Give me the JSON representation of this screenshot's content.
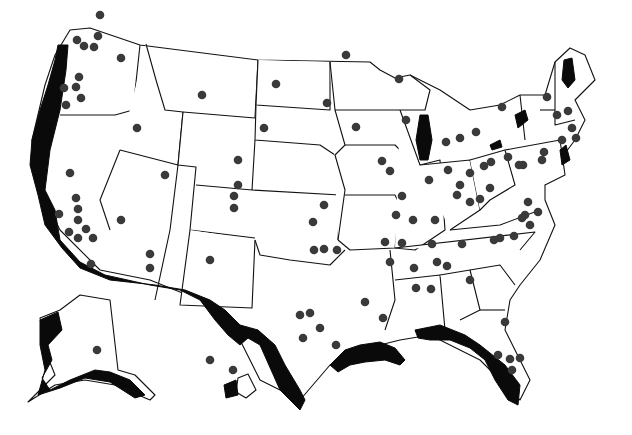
{
  "map": {
    "title": "",
    "width": 632,
    "height": 435,
    "colors": {
      "background": "#ffffff",
      "outline": "#111111",
      "shaded": "#0a0a0a",
      "dot": "#3a3a3a"
    },
    "legend": null,
    "regions": [
      {
        "name": "contiguous-us",
        "path": "M70,30 L90,28 L140,45 L258,60 L370,62 L380,70 L395,78 L410,75 L440,90 L470,110 L500,105 L520,95 L545,95 L555,62 L570,48 L585,55 L595,80 L575,100 L585,120 L575,140 L560,160 L545,175 L545,200 L555,225 L540,260 L520,285 L510,300 L505,330 L530,380 L520,400 L480,360 L430,335 L400,340 L360,350 L330,365 L300,400 L260,380 L230,320 L200,300 L150,280 L100,270 L60,230 L35,180 L32,140 L45,85 L55,55 Z"
      },
      {
        "name": "alaska",
        "path": "M40,318 L60,310 L80,295 L110,300 L118,370 L135,375 L155,395 L150,400 L115,385 L85,380 L55,385 L28,402 L40,390 L55,375 L45,350 Z"
      },
      {
        "name": "hawaii-big-island",
        "path": "M238,378 L248,374 L256,390 L246,398 L236,392 Z"
      }
    ],
    "state_lines": [
      "M140,45 L133,110",
      "M133,110 L115,115 L60,115",
      "M146,44 L156,80 L165,110 L183,112 L178,165 L120,150",
      "M183,112 L255,118 L258,60",
      "M120,150 L100,200 L110,230",
      "M178,165 L170,230 L155,300",
      "M183,112 L178,165 L196,167 L190,230 L255,238",
      "M258,60 L256,105 L330,110 L330,62",
      "M256,105 L255,140 L320,145 L335,155",
      "M255,140 L252,190 L196,185",
      "M252,190 L340,195 L338,240",
      "M190,230 L180,305 L252,308 L255,240",
      "M255,240 L260,255 L290,260 L330,265 L345,250",
      "M330,62 L335,110 L345,145 L335,155 L345,190 L338,240",
      "M335,110 L400,110",
      "M345,145 L395,145 L410,160",
      "M345,195 L395,195 L405,215",
      "M338,240 L350,250 L395,248 L400,200",
      "M400,110 L420,165 L440,160 L445,230 L415,250 L395,248",
      "M420,165 L470,160 L480,210 L450,230",
      "M470,160 L505,150 L515,185 L490,200 L480,210",
      "M505,150 L560,140 L565,175 L545,185",
      "M390,250 L395,300 L385,330",
      "M395,248 L535,232 L520,250",
      "M395,280 L440,275 L445,330 L420,330",
      "M440,275 L470,270 L480,310 L460,320",
      "M470,270 L500,265 L515,285",
      "M480,310 L505,310",
      "M450,230 L500,225 L540,210",
      "M410,75 L430,90 L425,110 L400,110",
      "M520,95 L525,140",
      "M555,62 L555,125 L575,120",
      "M540,110 L555,110"
    ],
    "shaded_areas": [
      {
        "name": "pacific-coast",
        "path": "M58,45 L68,45 L66,70 L60,110 L50,150 L45,190 L55,210 L60,240 L80,262 L105,275 L150,285 L180,290 L200,300 L215,320 L228,335 L240,345 L248,338 L260,345 L280,390 L300,410 L305,400 L300,390 L285,365 L275,345 L258,330 L240,325 L225,310 L210,300 L185,290 L155,285 L110,280 L80,268 L62,248 L45,225 L38,195 L30,165 L32,140 L40,110 L48,85 L55,60 Z"
      },
      {
        "name": "gulf-coast-tx-la",
        "path": "M330,365 L345,350 L360,345 L380,342 L395,348 L405,360 L400,365 L385,360 L365,362 L350,365 L338,372 Z"
      },
      {
        "name": "gulf-coast-fl",
        "path": "M415,330 L440,325 L465,335 L480,345 L505,365 L520,385 L518,405 L508,400 L495,380 L485,360 L470,348 L450,340 L430,340 L418,338 Z"
      },
      {
        "name": "lake-michigan",
        "path": "M420,115 L428,115 L432,140 L428,160 L420,160 L416,140 Z"
      },
      {
        "name": "lake-champlain-region",
        "path": "M564,60 L572,58 L575,80 L568,88 L562,80 Z"
      },
      {
        "name": "lake-ontario",
        "path": "M515,115 L525,110 L528,120 L518,128 Z"
      },
      {
        "name": "lake-erie",
        "path": "M490,145 L500,140 L502,147 L492,150 Z"
      },
      {
        "name": "atlantic-ne",
        "path": "M560,150 L566,145 L570,160 L562,165 Z"
      },
      {
        "name": "alaska-coast",
        "path": "M40,320 L58,312 L62,330 L48,345 L52,360 L42,378 L50,390 L70,380 L95,370 L110,372 L130,380 L145,395 L135,398 L110,382 L85,378 L60,388 L38,395 L45,370 L40,345 Z"
      },
      {
        "name": "hawaii",
        "path": "M224,385 L236,380 L238,395 L226,398 Z"
      }
    ],
    "dots": [
      [
        100,
        15
      ],
      [
        98,
        36
      ],
      [
        77,
        40
      ],
      [
        84,
        46
      ],
      [
        94,
        47
      ],
      [
        121,
        58
      ],
      [
        79,
        77
      ],
      [
        76,
        87
      ],
      [
        64,
        88
      ],
      [
        81,
        98
      ],
      [
        66,
        105
      ],
      [
        137,
        128
      ],
      [
        202,
        95
      ],
      [
        276,
        84
      ],
      [
        264,
        128
      ],
      [
        238,
        160
      ],
      [
        165,
        175
      ],
      [
        238,
        185
      ],
      [
        234,
        196
      ],
      [
        234,
        208
      ],
      [
        70,
        173
      ],
      [
        76,
        198
      ],
      [
        78,
        209
      ],
      [
        59,
        214
      ],
      [
        78,
        220
      ],
      [
        69,
        232
      ],
      [
        86,
        229
      ],
      [
        93,
        238
      ],
      [
        78,
        238
      ],
      [
        91,
        264
      ],
      [
        121,
        220
      ],
      [
        150,
        254
      ],
      [
        150,
        268
      ],
      [
        210,
        260
      ],
      [
        327,
        103
      ],
      [
        356,
        127
      ],
      [
        382,
        161
      ],
      [
        390,
        171
      ],
      [
        402,
        196
      ],
      [
        396,
        215
      ],
      [
        413,
        220
      ],
      [
        437,
        262
      ],
      [
        435,
        220
      ],
      [
        414,
        268
      ],
      [
        346,
        55
      ],
      [
        399,
        79
      ],
      [
        406,
        120
      ],
      [
        446,
        142
      ],
      [
        460,
        138
      ],
      [
        476,
        132
      ],
      [
        502,
        107
      ],
      [
        547,
        97
      ],
      [
        557,
        115
      ],
      [
        568,
        111
      ],
      [
        572,
        128
      ],
      [
        576,
        138
      ],
      [
        562,
        140
      ],
      [
        544,
        152
      ],
      [
        542,
        160
      ],
      [
        523,
        165
      ],
      [
        519,
        165
      ],
      [
        508,
        157
      ],
      [
        484,
        166
      ],
      [
        491,
        162
      ],
      [
        470,
        173
      ],
      [
        460,
        185
      ],
      [
        457,
        195
      ],
      [
        480,
        199
      ],
      [
        490,
        188
      ],
      [
        528,
        202
      ],
      [
        525,
        215
      ],
      [
        538,
        212
      ],
      [
        530,
        225
      ],
      [
        514,
        236
      ],
      [
        500,
        238
      ],
      [
        462,
        244
      ],
      [
        432,
        244
      ],
      [
        402,
        243
      ],
      [
        416,
        288
      ],
      [
        365,
        302
      ],
      [
        383,
        318
      ],
      [
        336,
        345
      ],
      [
        300,
        315
      ],
      [
        310,
        313
      ],
      [
        320,
        328
      ],
      [
        303,
        338
      ],
      [
        324,
        249
      ],
      [
        314,
        250
      ],
      [
        337,
        250
      ],
      [
        313,
        222
      ],
      [
        324,
        205
      ],
      [
        385,
        242
      ],
      [
        447,
        266
      ],
      [
        431,
        289
      ],
      [
        470,
        280
      ],
      [
        505,
        322
      ],
      [
        498,
        355
      ],
      [
        510,
        359
      ],
      [
        520,
        358
      ],
      [
        512,
        370
      ],
      [
        97,
        350
      ],
      [
        210,
        360
      ],
      [
        233,
        370
      ],
      [
        390,
        262
      ],
      [
        494,
        240
      ],
      [
        522,
        218
      ],
      [
        470,
        202
      ],
      [
        448,
        170
      ],
      [
        429,
        180
      ]
    ]
  }
}
